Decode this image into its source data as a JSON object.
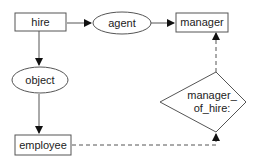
{
  "diagram": {
    "nodes": {
      "hire": {
        "label": "hire",
        "shape": "rectangle"
      },
      "agent": {
        "label": "agent",
        "shape": "ellipse"
      },
      "manager": {
        "label": "manager",
        "shape": "rectangle"
      },
      "object": {
        "label": "object",
        "shape": "ellipse"
      },
      "employee": {
        "label": "employee",
        "shape": "rectangle"
      },
      "manager_of_hire": {
        "label_line1": "manager_",
        "label_line2": "of_hire:",
        "shape": "diamond"
      }
    },
    "edges": [
      {
        "from": "hire",
        "to": "agent",
        "style": "solid"
      },
      {
        "from": "agent",
        "to": "manager",
        "style": "solid"
      },
      {
        "from": "hire",
        "to": "object",
        "style": "solid"
      },
      {
        "from": "object",
        "to": "employee",
        "style": "solid"
      },
      {
        "from": "employee",
        "to": "manager_of_hire",
        "style": "dashed"
      },
      {
        "from": "manager_of_hire",
        "to": "manager",
        "style": "dashed"
      }
    ],
    "colors": {
      "stroke": "#555555",
      "text": "#222222",
      "background": "#ffffff"
    }
  }
}
